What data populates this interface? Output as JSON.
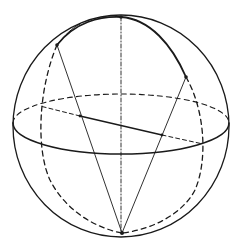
{
  "diagram": {
    "type": "sphere-geometry",
    "canvas": {
      "width": 240,
      "height": 248,
      "background": "#ffffff"
    },
    "stroke_color": "#1a1a1a",
    "sphere": {
      "cx": 121,
      "cy": 126,
      "rx": 108,
      "ry": 111
    },
    "equator": {
      "cx": 121,
      "cy": 125,
      "rx": 108,
      "ry": 29
    },
    "points": [
      {
        "name": "top",
        "x": 121,
        "y": 17
      },
      {
        "name": "upper-left",
        "x": 57,
        "y": 45
      },
      {
        "name": "upper-right",
        "x": 186,
        "y": 77
      },
      {
        "name": "bottom",
        "x": 122,
        "y": 233
      },
      {
        "name": "chord-left",
        "x": 80,
        "y": 116
      },
      {
        "name": "chord-right",
        "x": 162,
        "y": 135
      }
    ],
    "labels": []
  }
}
